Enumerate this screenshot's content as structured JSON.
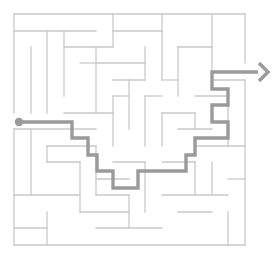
{
  "figure": {
    "type": "maze",
    "canvas_width": 279,
    "canvas_height": 265,
    "background_color": "#ffffff"
  },
  "maze": {
    "origin_x": 14,
    "origin_y": 14,
    "cell_size": 16.5,
    "cols": 14,
    "rows": 14,
    "wall_color": "#c9c9c9",
    "wall_width": 1.3,
    "border_label": "maze-outer-border",
    "outer_border": [
      {
        "name": "top-border",
        "x1": 14,
        "y1": 14,
        "x2": 245,
        "y2": 14
      },
      {
        "name": "left-border-upper",
        "x1": 14,
        "y1": 14,
        "x2": 14,
        "y2": 113
      },
      {
        "name": "left-border-lower",
        "x1": 14,
        "y1": 129,
        "x2": 14,
        "y2": 245
      },
      {
        "name": "bottom-border",
        "x1": 14,
        "y1": 245,
        "x2": 245,
        "y2": 245
      },
      {
        "name": "right-border-upper",
        "x1": 245,
        "y1": 14,
        "x2": 245,
        "y2": 63
      },
      {
        "name": "right-border-lower",
        "x1": 245,
        "y1": 80,
        "x2": 245,
        "y2": 245
      }
    ],
    "interior_walls": [
      {
        "x1": 14,
        "y1": 31,
        "x2": 96,
        "y2": 31
      },
      {
        "x1": 113,
        "y1": 14,
        "x2": 113,
        "y2": 47
      },
      {
        "x1": 113,
        "y1": 31,
        "x2": 162,
        "y2": 31
      },
      {
        "x1": 162,
        "y1": 14,
        "x2": 162,
        "y2": 31
      },
      {
        "x1": 212,
        "y1": 14,
        "x2": 212,
        "y2": 80
      },
      {
        "x1": 47,
        "y1": 31,
        "x2": 47,
        "y2": 113
      },
      {
        "x1": 64,
        "y1": 31,
        "x2": 64,
        "y2": 96
      },
      {
        "x1": 64,
        "y1": 47,
        "x2": 113,
        "y2": 47
      },
      {
        "x1": 96,
        "y1": 47,
        "x2": 96,
        "y2": 113
      },
      {
        "x1": 96,
        "y1": 63,
        "x2": 145,
        "y2": 63
      },
      {
        "x1": 145,
        "y1": 47,
        "x2": 145,
        "y2": 80
      },
      {
        "x1": 113,
        "y1": 80,
        "x2": 145,
        "y2": 80
      },
      {
        "x1": 129,
        "y1": 80,
        "x2": 129,
        "y2": 129
      },
      {
        "x1": 113,
        "y1": 96,
        "x2": 129,
        "y2": 96
      },
      {
        "x1": 113,
        "y1": 96,
        "x2": 113,
        "y2": 146
      },
      {
        "x1": 162,
        "y1": 31,
        "x2": 162,
        "y2": 80
      },
      {
        "x1": 178,
        "y1": 47,
        "x2": 212,
        "y2": 47
      },
      {
        "x1": 178,
        "y1": 47,
        "x2": 178,
        "y2": 96
      },
      {
        "x1": 162,
        "y1": 80,
        "x2": 178,
        "y2": 80
      },
      {
        "x1": 212,
        "y1": 80,
        "x2": 245,
        "y2": 80
      },
      {
        "x1": 195,
        "y1": 96,
        "x2": 228,
        "y2": 96
      },
      {
        "x1": 228,
        "y1": 96,
        "x2": 228,
        "y2": 146
      },
      {
        "x1": 162,
        "y1": 113,
        "x2": 195,
        "y2": 113
      },
      {
        "x1": 195,
        "y1": 113,
        "x2": 195,
        "y2": 129
      },
      {
        "x1": 145,
        "y1": 96,
        "x2": 162,
        "y2": 96
      },
      {
        "x1": 145,
        "y1": 96,
        "x2": 145,
        "y2": 146
      },
      {
        "x1": 14,
        "y1": 129,
        "x2": 96,
        "y2": 129
      },
      {
        "x1": 64,
        "y1": 113,
        "x2": 113,
        "y2": 113
      },
      {
        "x1": 31,
        "y1": 129,
        "x2": 31,
        "y2": 195
      },
      {
        "x1": 47,
        "y1": 146,
        "x2": 96,
        "y2": 146
      },
      {
        "x1": 47,
        "y1": 146,
        "x2": 47,
        "y2": 162
      },
      {
        "x1": 47,
        "y1": 162,
        "x2": 80,
        "y2": 162
      },
      {
        "x1": 96,
        "y1": 146,
        "x2": 96,
        "y2": 195
      },
      {
        "x1": 80,
        "y1": 162,
        "x2": 80,
        "y2": 212
      },
      {
        "x1": 113,
        "y1": 162,
        "x2": 145,
        "y2": 162
      },
      {
        "x1": 14,
        "y1": 195,
        "x2": 80,
        "y2": 195
      },
      {
        "x1": 96,
        "y1": 195,
        "x2": 129,
        "y2": 195
      },
      {
        "x1": 145,
        "y1": 162,
        "x2": 145,
        "y2": 212
      },
      {
        "x1": 162,
        "y1": 162,
        "x2": 195,
        "y2": 162
      },
      {
        "x1": 195,
        "y1": 146,
        "x2": 245,
        "y2": 146
      },
      {
        "x1": 195,
        "y1": 162,
        "x2": 195,
        "y2": 195
      },
      {
        "x1": 212,
        "y1": 162,
        "x2": 212,
        "y2": 195
      },
      {
        "x1": 162,
        "y1": 195,
        "x2": 228,
        "y2": 195
      },
      {
        "x1": 228,
        "y1": 179,
        "x2": 245,
        "y2": 179
      },
      {
        "x1": 228,
        "y1": 212,
        "x2": 228,
        "y2": 245
      },
      {
        "x1": 47,
        "y1": 212,
        "x2": 47,
        "y2": 245
      },
      {
        "x1": 80,
        "y1": 212,
        "x2": 129,
        "y2": 212
      },
      {
        "x1": 14,
        "y1": 228,
        "x2": 47,
        "y2": 228
      },
      {
        "x1": 96,
        "y1": 228,
        "x2": 162,
        "y2": 228
      },
      {
        "x1": 129,
        "y1": 195,
        "x2": 129,
        "y2": 228
      },
      {
        "x1": 178,
        "y1": 212,
        "x2": 212,
        "y2": 212
      },
      {
        "x1": 162,
        "y1": 113,
        "x2": 162,
        "y2": 146
      },
      {
        "x1": 178,
        "y1": 129,
        "x2": 212,
        "y2": 129
      },
      {
        "x1": 80,
        "y1": 63,
        "x2": 96,
        "y2": 63
      },
      {
        "x1": 31,
        "y1": 47,
        "x2": 31,
        "y2": 113
      },
      {
        "x1": 96,
        "y1": 179,
        "x2": 129,
        "y2": 179
      }
    ]
  },
  "solution": {
    "path_color": "#9a9a9a",
    "path_width": 3.4,
    "start_label": "start-dot",
    "end_label": "exit-arrow",
    "start_point": {
      "x": 19,
      "y": 122
    },
    "start_dot_radius": 4.2,
    "points": [
      {
        "x": 19,
        "y": 122
      },
      {
        "x": 72,
        "y": 122
      },
      {
        "x": 72,
        "y": 138
      },
      {
        "x": 88,
        "y": 138
      },
      {
        "x": 88,
        "y": 155
      },
      {
        "x": 97,
        "y": 155
      },
      {
        "x": 97,
        "y": 171
      },
      {
        "x": 113,
        "y": 171
      },
      {
        "x": 113,
        "y": 188
      },
      {
        "x": 138,
        "y": 188
      },
      {
        "x": 138,
        "y": 171
      },
      {
        "x": 186,
        "y": 171
      },
      {
        "x": 186,
        "y": 155
      },
      {
        "x": 195,
        "y": 155
      },
      {
        "x": 195,
        "y": 138
      },
      {
        "x": 228,
        "y": 138
      },
      {
        "x": 228,
        "y": 122
      },
      {
        "x": 212,
        "y": 122
      },
      {
        "x": 212,
        "y": 105
      },
      {
        "x": 228,
        "y": 105
      },
      {
        "x": 228,
        "y": 89
      },
      {
        "x": 212,
        "y": 89
      },
      {
        "x": 212,
        "y": 72
      },
      {
        "x": 258,
        "y": 72
      }
    ],
    "arrow_tip": {
      "x": 268,
      "y": 72
    },
    "arrow_size": 9
  }
}
